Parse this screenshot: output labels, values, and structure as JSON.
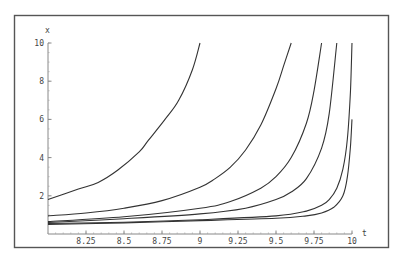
{
  "chart_data": {
    "type": "line",
    "title": "",
    "xlabel": "t",
    "ylabel": "x",
    "xlim": [
      8,
      10
    ],
    "ylim": [
      0,
      10
    ],
    "grid": false,
    "legend": null,
    "x_ticks": [
      8.25,
      8.5,
      8.75,
      9,
      9.25,
      9.5,
      9.75,
      10
    ],
    "x_tick_labels": [
      "8.25",
      "8.5",
      "8.75",
      "9",
      "9.25",
      "9.5",
      "9.75",
      "10"
    ],
    "y_ticks": [
      2,
      4,
      6,
      8,
      10
    ],
    "y_tick_labels": [
      "2",
      "4",
      "6",
      "8",
      "10"
    ],
    "series": [
      {
        "name": "curve-1",
        "x": [
          8.0,
          8.2,
          8.33,
          8.46,
          8.6,
          8.66,
          8.77,
          8.86,
          8.95,
          9.0
        ],
        "values": [
          1.8,
          2.35,
          2.7,
          3.35,
          4.3,
          4.9,
          6.0,
          7.0,
          8.6,
          10.0
        ]
      },
      {
        "name": "curve-2",
        "x": [
          8.0,
          8.25,
          8.5,
          8.75,
          9.0,
          9.1,
          9.2,
          9.3,
          9.4,
          9.5,
          9.55,
          9.6
        ],
        "values": [
          0.95,
          1.1,
          1.35,
          1.75,
          2.45,
          2.9,
          3.5,
          4.4,
          5.7,
          7.6,
          8.8,
          10.0
        ]
      },
      {
        "name": "curve-3",
        "x": [
          8.0,
          8.5,
          9.0,
          9.2,
          9.4,
          9.5,
          9.6,
          9.7,
          9.75,
          9.8
        ],
        "values": [
          0.65,
          0.9,
          1.35,
          1.7,
          2.4,
          3.0,
          4.0,
          5.8,
          7.5,
          10.0
        ]
      },
      {
        "name": "curve-4",
        "x": [
          8.0,
          8.5,
          9.0,
          9.3,
          9.5,
          9.6,
          9.7,
          9.8,
          9.85,
          9.9
        ],
        "values": [
          0.6,
          0.8,
          1.05,
          1.35,
          1.8,
          2.2,
          2.9,
          4.5,
          6.3,
          10.0
        ]
      },
      {
        "name": "curve-5",
        "x": [
          8.0,
          8.5,
          9.0,
          9.5,
          9.7,
          9.8,
          9.85,
          9.9,
          9.94,
          9.97,
          9.99,
          10.0
        ],
        "values": [
          0.55,
          0.62,
          0.75,
          0.95,
          1.2,
          1.5,
          1.8,
          2.4,
          3.4,
          5.0,
          7.5,
          10.0
        ]
      },
      {
        "name": "curve-6",
        "x": [
          8.0,
          8.5,
          9.0,
          9.5,
          9.7,
          9.8,
          9.88,
          9.94,
          9.97,
          9.99,
          10.0
        ],
        "values": [
          0.5,
          0.58,
          0.7,
          0.82,
          0.95,
          1.1,
          1.4,
          2.0,
          3.0,
          4.6,
          6.0
        ]
      }
    ]
  }
}
